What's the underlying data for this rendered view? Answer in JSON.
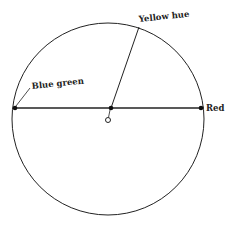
{
  "diagram": {
    "type": "color-circle",
    "stroke_color": "#222222",
    "background": "#ffffff",
    "circle": {
      "cx": 108,
      "cy": 119,
      "r": 96
    },
    "diameter": {
      "x1": 15,
      "y1": 108,
      "x2": 201,
      "y2": 108
    },
    "radius_line": {
      "x1": 111,
      "y1": 108,
      "x2": 139,
      "y2": 27
    },
    "points": [
      {
        "name": "blue-green-point",
        "x": 15,
        "y": 108
      },
      {
        "name": "center-point",
        "x": 111,
        "y": 108
      },
      {
        "name": "red-point",
        "x": 201,
        "y": 108
      }
    ],
    "origin_marker": {
      "x": 108,
      "y": 120,
      "r": 2.5
    },
    "labels": {
      "yellow_hue": "Yellow hue",
      "blue_green": "Blue green",
      "red": "Red"
    }
  }
}
